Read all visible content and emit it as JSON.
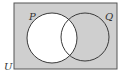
{
  "diagram": {
    "type": "venn",
    "universal_label": "U",
    "sets": [
      {
        "label": "P",
        "shaded": false
      },
      {
        "label": "Q",
        "shaded": true
      }
    ],
    "shaded_region": "P'",
    "colors": {
      "shade": "#cfcfcf",
      "unshaded": "#ffffff",
      "stroke": "#3a3a3a"
    }
  }
}
